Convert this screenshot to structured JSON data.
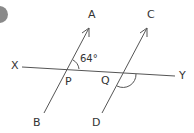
{
  "diagram": {
    "type": "geometry-parallel-lines",
    "labels": {
      "A": "A",
      "B": "B",
      "C": "C",
      "D": "D",
      "X": "X",
      "Y": "Y",
      "P": "P",
      "Q": "Q"
    },
    "angle_label": "64°",
    "colors": {
      "line": "#555555",
      "bullet": "#8a8a8a",
      "text": "#333333"
    }
  }
}
